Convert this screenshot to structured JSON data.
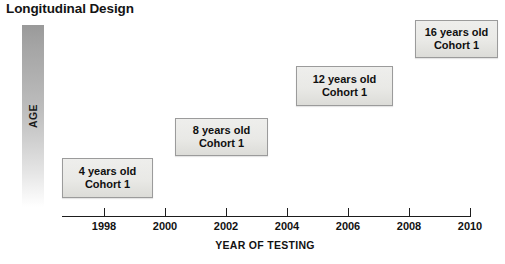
{
  "title": "Longitudinal Design",
  "y_axis": {
    "label": "AGE"
  },
  "x_axis": {
    "label": "YEAR OF TESTING",
    "ticks": [
      "1998",
      "2000",
      "2002",
      "2004",
      "2006",
      "2008",
      "2010"
    ]
  },
  "boxes": [
    {
      "age": "4 years old",
      "cohort": "Cohort 1"
    },
    {
      "age": "8 years old",
      "cohort": "Cohort 1"
    },
    {
      "age": "12 years old",
      "cohort": "Cohort 1"
    },
    {
      "age": "16 years old",
      "cohort": "Cohort 1"
    }
  ],
  "chart_data": {
    "type": "scatter",
    "title": "Longitudinal Design",
    "xlabel": "YEAR OF TESTING",
    "ylabel": "AGE",
    "xlim": [
      1997,
      2011
    ],
    "grid": false,
    "legend": "none",
    "x": [
      1998,
      2002,
      2006,
      2009
    ],
    "y": [
      4,
      8,
      12,
      16
    ],
    "point_labels": [
      "4 years old Cohort 1",
      "8 years old Cohort 1",
      "12 years old Cohort 1",
      "16 years old Cohort 1"
    ],
    "series": [
      {
        "name": "Cohort 1",
        "points": [
          {
            "year": 1998,
            "age": 4
          },
          {
            "year": 2002,
            "age": 8
          },
          {
            "year": 2006,
            "age": 12
          },
          {
            "year": 2009,
            "age": 16
          }
        ]
      }
    ]
  },
  "geometry": {
    "boxes": [
      {
        "left": 62,
        "top": 158,
        "width": 91,
        "height": 40
      },
      {
        "left": 175,
        "top": 118,
        "width": 93,
        "height": 38
      },
      {
        "left": 296,
        "top": 66,
        "width": 97,
        "height": 40
      },
      {
        "left": 415,
        "top": 20,
        "width": 83,
        "height": 38
      }
    ],
    "tick_x": [
      104,
      165,
      226,
      287,
      348,
      409,
      470
    ]
  }
}
